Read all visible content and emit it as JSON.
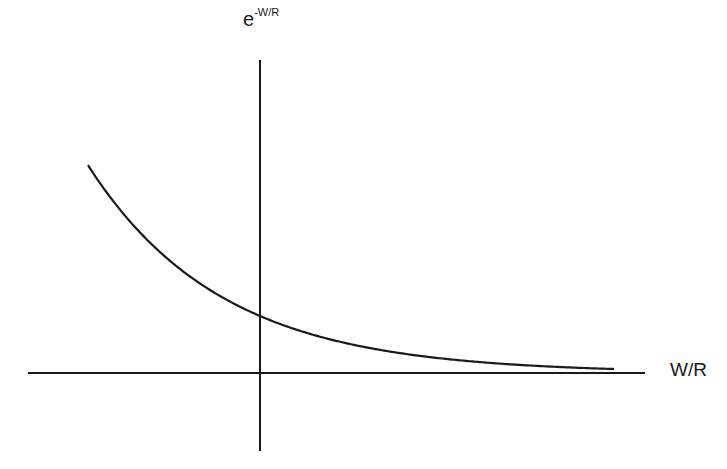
{
  "diagram": {
    "title": "",
    "y_axis_label": {
      "base": "e",
      "exponent": "-W/R"
    },
    "x_axis_label": "W/R",
    "curve": {
      "description": "exponential decay e^(-W/R)",
      "function": "exp(-x)",
      "y_intercept_relative": 1
    },
    "colors": {
      "line": "#1a1a1a",
      "background": "#ffffff"
    }
  },
  "chart_data": {
    "type": "line",
    "title": "",
    "xlabel": "W/R",
    "ylabel": "e^-W/R",
    "grid": false,
    "series": [
      {
        "name": "e^-W/R",
        "x": [
          -1.3,
          -1,
          -0.5,
          0,
          0.5,
          1,
          1.5,
          2,
          2.5,
          3,
          3.5,
          4
        ],
        "values": [
          3.67,
          2.72,
          1.65,
          1.0,
          0.61,
          0.37,
          0.22,
          0.14,
          0.08,
          0.05,
          0.03,
          0.02
        ]
      }
    ]
  }
}
